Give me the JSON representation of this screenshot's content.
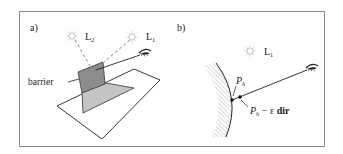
{
  "figure": {
    "panel_a": {
      "label": "a)",
      "lights": [
        {
          "name": "L",
          "subscript": "2"
        },
        {
          "name": "L",
          "subscript": "1"
        }
      ],
      "barrier_label": "barrier",
      "icons": [
        "sun-icon",
        "sun-icon",
        "eye-icon"
      ]
    },
    "panel_b": {
      "label": "b)",
      "light": {
        "name": "L",
        "subscript": "1"
      },
      "point_hit": {
        "name": "P",
        "subscript": "h"
      },
      "point_offset": {
        "name": "P",
        "subscript": "h",
        "suffix": " − ε ",
        "bold": "dir"
      },
      "icons": [
        "sun-icon",
        "eye-icon"
      ]
    },
    "colors": {
      "frame": "#888888",
      "barrier": "#8c8c8c",
      "shadow": "#c4c4c4",
      "line": "#222222",
      "dashed": "#777777",
      "hatch": "#aaaaaa"
    }
  }
}
